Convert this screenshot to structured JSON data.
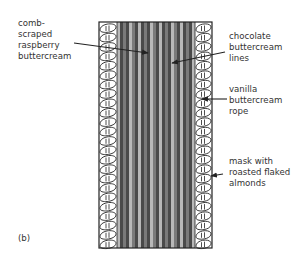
{
  "figure": {
    "panel_label": "(b)",
    "colors": {
      "outline": "#222222",
      "text": "#333333",
      "stripe_dark": "#4a4a4a",
      "stripe_mid": "#7a7a7a",
      "stripe_light": "#b8b8b8",
      "rope_fill": "#ffffff"
    },
    "labels": [
      {
        "id": "raspberry",
        "lines": [
          "comb-",
          "scraped",
          "raspberry",
          "buttercream"
        ]
      },
      {
        "id": "chocolate",
        "lines": [
          "chocolate",
          "buttercream",
          "lines"
        ]
      },
      {
        "id": "vanilla",
        "lines": [
          "vanilla",
          "buttercream",
          "rope"
        ]
      },
      {
        "id": "almonds",
        "lines": [
          "mask with",
          "roasted flaked",
          "almonds"
        ]
      }
    ]
  }
}
